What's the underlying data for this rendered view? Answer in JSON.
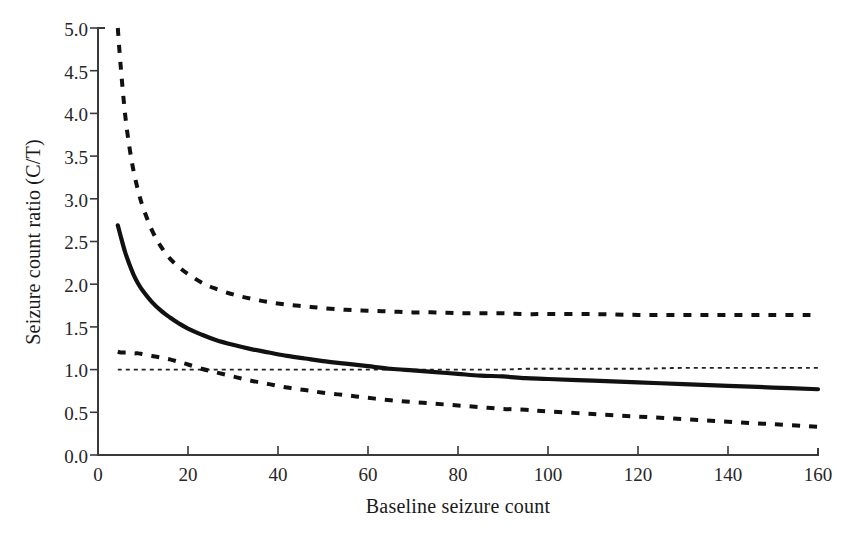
{
  "chart_data": {
    "type": "line",
    "title": "",
    "xlabel": "Baseline seizure count",
    "ylabel": "Seizure count ratio (C/T)",
    "xlim": [
      0,
      160
    ],
    "ylim": [
      0.0,
      5.0
    ],
    "xticks": [
      0,
      20,
      40,
      60,
      80,
      100,
      120,
      140,
      160
    ],
    "xtick_labels": [
      "0",
      "20",
      "40",
      "60",
      "80",
      "100",
      "120",
      "140",
      "160"
    ],
    "yticks": [
      0.0,
      0.5,
      1.0,
      1.5,
      2.0,
      2.5,
      3.0,
      3.5,
      4.0,
      4.5,
      5.0
    ],
    "ytick_labels": [
      "0.0",
      "0.5",
      "1.0",
      "1.5",
      "2.0",
      "2.5",
      "3.0",
      "3.5",
      "4.0",
      "4.5",
      "5.0"
    ],
    "grid": false,
    "legend": false,
    "legend_position": "none",
    "x": [
      4.4,
      5,
      6,
      7,
      8,
      9,
      10,
      12,
      14,
      16,
      18,
      20,
      23,
      26,
      30,
      34,
      38,
      42,
      46,
      50,
      55,
      60,
      65,
      70,
      75,
      80,
      85,
      90,
      95,
      100,
      110,
      120,
      130,
      140,
      150,
      160
    ],
    "series": [
      {
        "name": "Upper 95% confidence limit",
        "style": "dashed",
        "color": "#111111",
        "values": [
          5.0,
          4.58,
          4.0,
          3.6,
          3.3,
          3.08,
          2.9,
          2.63,
          2.44,
          2.3,
          2.2,
          2.12,
          2.02,
          1.95,
          1.88,
          1.83,
          1.79,
          1.76,
          1.74,
          1.72,
          1.7,
          1.69,
          1.68,
          1.67,
          1.67,
          1.66,
          1.66,
          1.66,
          1.65,
          1.65,
          1.65,
          1.64,
          1.64,
          1.64,
          1.64,
          1.64
        ]
      },
      {
        "name": "Point estimate (seizure count ratio)",
        "style": "solid",
        "color": "#111111",
        "values": [
          2.69,
          2.57,
          2.38,
          2.23,
          2.1,
          2.0,
          1.92,
          1.79,
          1.69,
          1.61,
          1.54,
          1.48,
          1.41,
          1.35,
          1.29,
          1.24,
          1.2,
          1.16,
          1.13,
          1.1,
          1.07,
          1.04,
          1.01,
          0.99,
          0.97,
          0.95,
          0.93,
          0.92,
          0.9,
          0.89,
          0.87,
          0.85,
          0.83,
          0.81,
          0.79,
          0.77
        ]
      },
      {
        "name": "Lower 95% confidence limit",
        "style": "dashed",
        "color": "#111111",
        "values": [
          1.21,
          1.2,
          1.2,
          1.2,
          1.19,
          1.19,
          1.18,
          1.16,
          1.14,
          1.12,
          1.09,
          1.06,
          1.01,
          0.97,
          0.92,
          0.87,
          0.83,
          0.79,
          0.76,
          0.73,
          0.7,
          0.67,
          0.64,
          0.62,
          0.6,
          0.58,
          0.56,
          0.54,
          0.53,
          0.51,
          0.48,
          0.45,
          0.42,
          0.39,
          0.36,
          0.33
        ]
      },
      {
        "name": "Reference line (ratio = 1)",
        "style": "fine-dotted",
        "color": "#222222",
        "values": [
          1.0,
          1.0,
          1.0,
          1.0,
          1.0,
          1.0,
          1.0,
          1.0,
          1.0,
          1.0,
          1.0,
          1.0,
          1.0,
          1.0,
          1.0,
          1.0,
          1.0,
          1.0,
          1.0,
          1.0,
          1.0,
          1.0,
          1.0,
          1.0,
          1.0,
          1.0,
          1.0,
          1.0,
          1.01,
          1.01,
          1.01,
          1.01,
          1.02,
          1.02,
          1.02,
          1.02
        ]
      }
    ],
    "annotations": []
  },
  "axes": {
    "x_title": "Baseline seizure count",
    "y_title": "Seizure count ratio (C/T)"
  },
  "xtick_labels": {
    "t0": "0",
    "t1": "20",
    "t2": "40",
    "t3": "60",
    "t4": "80",
    "t5": "100",
    "t6": "120",
    "t7": "140",
    "t8": "160"
  },
  "ytick_labels": {
    "t0": "0.0",
    "t1": "0.5",
    "t2": "1.0",
    "t3": "1.5",
    "t4": "2.0",
    "t5": "2.5",
    "t6": "3.0",
    "t7": "3.5",
    "t8": "4.0",
    "t9": "4.5",
    "t10": "5.0"
  }
}
